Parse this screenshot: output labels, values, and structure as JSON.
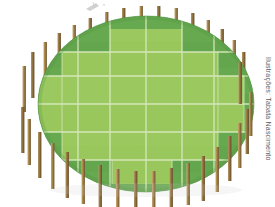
{
  "canvas": {
    "width": 275,
    "height": 207,
    "background": "#ffffff"
  },
  "illustration": {
    "subject": "soccer-field-oval-stadium-top-view",
    "title": "Campo de futebol visto de cima"
  },
  "credit": {
    "text": "Ilustrações: Tabata Nascimento",
    "color": "#5b5b5b",
    "orientation": "vertical"
  },
  "palette": {
    "grass_dark": "#5da24b",
    "grass_dark_2": "#63a950",
    "grass_light": "#9ac95c",
    "grass_light_2": "#a3ce66",
    "grass_mid": "#7fba52",
    "line_white": "#eaf5d8",
    "line_white_soft": "#dff0c9",
    "post_light": "#b99a66",
    "post_mid": "#a07f4f",
    "post_dark": "#7a5e36",
    "post_top": "#cdb487",
    "shadow": "#4a8a3c",
    "background": "#ffffff",
    "smudge": "#8a8a8a"
  },
  "field": {
    "shape": "ellipse",
    "center_x": 146,
    "center_y": 104,
    "radius_x": 108,
    "radius_y": 88,
    "outer_fill": "grass_dark",
    "inner_fill": "grass_light",
    "mow_pattern": "checkerboard-stripes",
    "grid_columns": 5,
    "grid_rows": 4,
    "line_width": 1.2
  },
  "inner_pitch": {
    "description": "stepped light-green playing area inset within the oval",
    "left": 42,
    "top": 30,
    "right": 250,
    "bottom": 185
  },
  "posts": {
    "count": 30,
    "label": "wooden-perimeter-post",
    "width": 3.4,
    "fill_light": "#b99a66",
    "fill_dark": "#7a5e36"
  },
  "grid_lines_vertical": [
    78,
    110,
    146,
    182,
    214
  ],
  "grid_lines_horizontal": [
    52,
    76,
    104,
    132,
    160
  ],
  "smudge": {
    "present": true,
    "label": "pencil-smudge-artifact",
    "x": 84,
    "y": 2
  }
}
